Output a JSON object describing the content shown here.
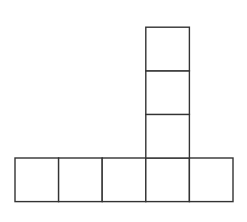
{
  "diagram": {
    "line_color": "#333333",
    "fill_color": "#ffffff",
    "stroke_width": 1.4,
    "cell_size": 43.6,
    "squares": [
      {
        "id": "row-1",
        "x": 15,
        "y": 158
      },
      {
        "id": "row-2",
        "x": 58.6,
        "y": 158
      },
      {
        "id": "row-3",
        "x": 102.2,
        "y": 158
      },
      {
        "id": "row-4",
        "x": 145.8,
        "y": 158
      },
      {
        "id": "row-5",
        "x": 189.4,
        "y": 158
      },
      {
        "id": "col-1",
        "x": 145.8,
        "y": 114.4
      },
      {
        "id": "col-2",
        "x": 145.8,
        "y": 70.8
      },
      {
        "id": "col-3",
        "x": 145.8,
        "y": 27.2
      }
    ]
  }
}
